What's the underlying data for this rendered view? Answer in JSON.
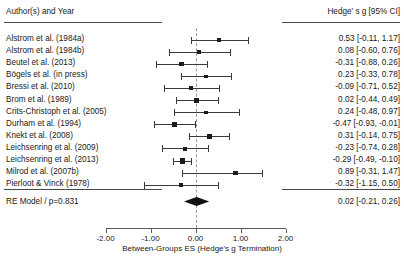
{
  "header": {
    "author_column": "Author(s) and Year",
    "estimate_column": "Hedge' s g  [95% CI]"
  },
  "summary": {
    "label": "RE Model / p=0.831",
    "estimate_text": "0.02  [-0.21,  0.26]",
    "estimate": 0.02,
    "ci_low": -0.21,
    "ci_high": 0.26
  },
  "axis": {
    "title": "Between-Groups ES (Hedge's g Termination)",
    "ticks": [
      "-2.00",
      "-1.00",
      "0.00",
      "1.00",
      "2.00"
    ],
    "tick_values": [
      -2,
      -1,
      0,
      1,
      2
    ],
    "reference_line": 0
  },
  "colors": {
    "marker": "#1c1c1c",
    "ci": "#3a3a3a",
    "rule": "#4a4a4a",
    "axis": "#5a5a5a",
    "zero_line": "#9a9a9a",
    "text": "#202020",
    "background": "#ffffff"
  },
  "chart_data": {
    "type": "forest",
    "title": "",
    "xlabel": "Between-Groups ES (Hedge's g Termination)",
    "ylabel": "",
    "xlim": [
      -2.4,
      2.4
    ],
    "grid": false,
    "legend": "none",
    "effect_measure": "Hedge's g",
    "categories": [
      "Alstrom et al. (1984a)",
      "Alstrom et al. (1984b)",
      "Beutel et al. (2013)",
      "Bögels et al. (in press)",
      "Bressi et al. (2010)",
      "Brom et al. (1989)",
      "Crits-Christoph et al. (2005)",
      "Durham et al. (1994)",
      "Knekt et al. (2008)",
      "Leichsenring et al. (2009)",
      "Leichsenring et al. (2013)",
      "Milrod et al. (2007b)",
      "Pierloot & Vinck (1978)"
    ],
    "values": [
      0.53,
      0.08,
      -0.31,
      0.23,
      -0.09,
      0.02,
      0.24,
      -0.47,
      0.31,
      -0.23,
      -0.29,
      0.89,
      -0.32
    ],
    "ci_low": [
      -0.11,
      -0.6,
      -0.88,
      -0.33,
      -0.71,
      -0.44,
      -0.48,
      -0.93,
      -0.14,
      -0.74,
      -0.49,
      -0.31,
      -1.15
    ],
    "ci_high": [
      1.17,
      0.76,
      0.26,
      0.78,
      0.52,
      0.49,
      0.97,
      -0.01,
      0.75,
      0.28,
      -0.1,
      1.47,
      0.5
    ],
    "estimate_labels": [
      "0.53  [-0.11,  1.17]",
      "0.08  [-0.60,  0.76]",
      "-0.31  [-0.88,  0.26]",
      "0.23  [-0.33,  0.78]",
      "-0.09  [-0.71,  0.52]",
      "0.02  [-0.44,  0.49]",
      "0.24  [-0.48,  0.97]",
      "-0.47  [-0.93, -0.01]",
      "0.31  [-0.14,  0.75]",
      "-0.23  [-0.74,  0.28]",
      "-0.29  [-0.49, -0.10]",
      "0.89  [-0.31,  1.47]",
      "-0.32  [-1.15,  0.50]"
    ],
    "marker_sizes": [
      4,
      4.2,
      4.4,
      3.6,
      4,
      4.6,
      3.8,
      4.6,
      4.8,
      4.4,
      5.6,
      4.2,
      3.6
    ],
    "summary": {
      "label": "RE Model / p=0.831",
      "value": 0.02,
      "ci_low": -0.21,
      "ci_high": 0.26,
      "estimate_label": "0.02  [-0.21,  0.26]"
    }
  }
}
